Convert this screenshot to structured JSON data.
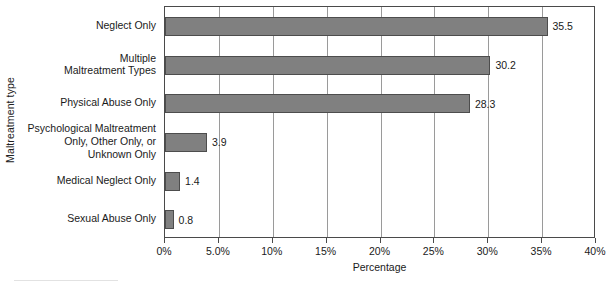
{
  "chart_data": {
    "type": "bar",
    "orientation": "horizontal",
    "title": "",
    "xlabel": "Percentage",
    "ylabel": "Maltreatment type",
    "categories": [
      "Neglect Only",
      "Multiple\nMaltreatment Types",
      "Physical Abuse Only",
      "Psychological Maltreatment\nOnly, Other Only, or\nUnknown Only",
      "Medical Neglect Only",
      "Sexual Abuse Only"
    ],
    "values": [
      35.5,
      30.2,
      28.3,
      3.9,
      1.4,
      0.8
    ],
    "data_labels": [
      "35.5",
      "30.2",
      "28.3",
      "3.9",
      "1.4",
      "0.8"
    ],
    "xlim": [
      0,
      40
    ],
    "xticks": [
      0,
      5,
      10,
      15,
      20,
      25,
      30,
      35,
      40
    ],
    "xtick_labels": [
      "0%",
      "5.0%",
      "10%",
      "15%",
      "20%",
      "25%",
      "30%",
      "35%",
      "40%"
    ],
    "grid": "vertical",
    "legend": null,
    "colors": {
      "bar_fill": "#808080",
      "bar_border": "#4d4d4d",
      "gridline": "#9a9a9a",
      "frame": "#4a4a4a",
      "plot_background": "#ffffff",
      "text": "#1a1a1a"
    }
  }
}
